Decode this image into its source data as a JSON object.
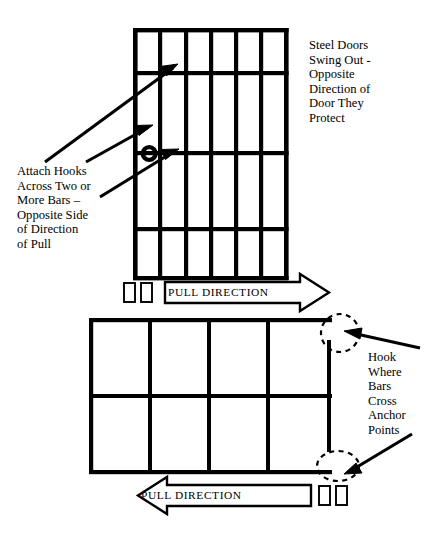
{
  "diagram": {
    "stroke_color": "#000000",
    "background_color": "#ffffff",
    "notes": {
      "steel_doors": "Steel Doors\nSwing Out -\nOpposite\nDirection of\nDoor They\nProtect",
      "attach_hooks": "Attach Hooks\nAcross Two or\nMore Bars –\nOpposite Side\nof Direction\nof Pull",
      "hook_anchor": "Hook\nWhere\nBars\nCross\nAnchor\nPoints"
    },
    "arrows": {
      "pull_direction_top_label": "PULL DIRECTION",
      "pull_direction_bottom_label": "PULL DIRECTION",
      "top_arrow_points": "right",
      "bottom_arrow_points": "left"
    },
    "front_grate": {
      "name": "front-view-bar-grate",
      "columns": 6,
      "horizontal_bar_count": 5,
      "lock_ring": "present"
    },
    "plan_grate": {
      "name": "plan-view-bar-grate",
      "columns": 4,
      "rows": 2,
      "anchor_circle_count": 2
    },
    "hooks": {
      "top_hook_count": 2,
      "bottom_hook_count": 2
    }
  }
}
